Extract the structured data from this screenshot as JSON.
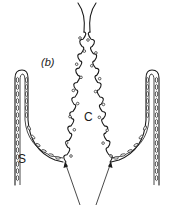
{
  "figure": {
    "panel_label": "(b)",
    "labels": {
      "center": "C",
      "side": "S"
    },
    "arrows": {
      "count": 2,
      "description": "two arrows pointing up toward the junctions at the base"
    },
    "colors": {
      "ink": "#1a1a1a",
      "background": "#ffffff"
    }
  }
}
